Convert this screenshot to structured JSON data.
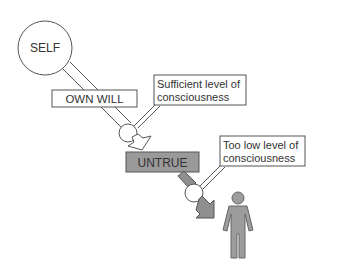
{
  "diagram": {
    "self_label": "SELF",
    "own_will_label": "OWN WILL",
    "sufficient_label_line1": "Sufficient level of",
    "sufficient_label_line2": "consciousness",
    "untrue_label": "UNTRUE",
    "too_low_label_line1": "Too low level of",
    "too_low_label_line2": "consciousness",
    "colors": {
      "stroke": "#555555",
      "untrue_fill": "#9a9a9a",
      "arrow_fill": "#8f8f8f",
      "person_fill": "#9c9c9c",
      "background": "#ffffff"
    }
  }
}
